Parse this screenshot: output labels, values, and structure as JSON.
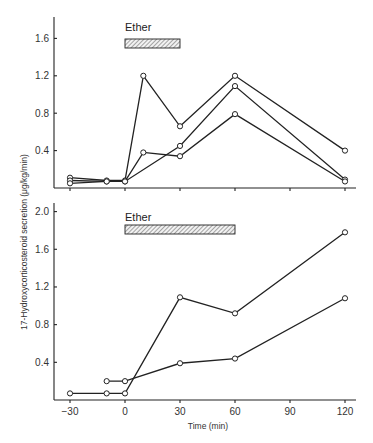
{
  "chart_data": [
    {
      "type": "line",
      "panel": "top",
      "title": "",
      "xlabel": "",
      "ylabel": "17-Hydroxycorticosteroid secretion (μg/kg/min)",
      "x_ticks": [
        -30,
        0,
        30,
        60,
        90,
        120
      ],
      "x_tick_labels_visible": false,
      "y_ticks": [
        0.4,
        0.8,
        1.2,
        1.6
      ],
      "y_tick_labels": [
        "0.4",
        "0.8",
        "1.2",
        "1.6"
      ],
      "xlim": [
        -30,
        120
      ],
      "ylim": [
        0,
        1.8
      ],
      "grid": false,
      "annotation": {
        "label": "Ether",
        "x_start": 0,
        "x_end": 30
      },
      "series": [
        {
          "name": "Subject 1",
          "x": [
            -30,
            -10,
            0,
            10,
            30,
            60,
            120
          ],
          "values": [
            0.11,
            0.08,
            0.08,
            1.2,
            0.66,
            1.2,
            0.4
          ]
        },
        {
          "name": "Subject 2",
          "x": [
            -30,
            -10,
            0,
            30,
            60,
            120
          ],
          "values": [
            0.08,
            0.07,
            0.07,
            0.45,
            1.09,
            0.09
          ]
        },
        {
          "name": "Subject 3",
          "x": [
            -30,
            -10,
            0,
            10,
            30,
            60,
            120
          ],
          "values": [
            0.05,
            0.07,
            0.07,
            0.38,
            0.34,
            0.79,
            0.07
          ]
        }
      ]
    },
    {
      "type": "line",
      "panel": "bottom",
      "title": "",
      "xlabel": "Time (min)",
      "ylabel": "17-Hydroxycorticosteroid secretion (μg/kg/min)",
      "x_ticks": [
        -30,
        0,
        30,
        60,
        90,
        120
      ],
      "x_tick_labels": [
        "−30",
        "0",
        "30",
        "60",
        "90",
        "120"
      ],
      "y_ticks": [
        0.4,
        0.8,
        1.2,
        1.6,
        2.0
      ],
      "y_tick_labels": [
        "0.4",
        "0.8",
        "1.2",
        "1.6",
        "2.0"
      ],
      "xlim": [
        -30,
        120
      ],
      "ylim": [
        0,
        2.1
      ],
      "grid": false,
      "annotation": {
        "label": "Ether",
        "x_start": 0,
        "x_end": 60
      },
      "series": [
        {
          "name": "Subject A",
          "x": [
            -30,
            -10,
            0,
            30,
            60,
            120
          ],
          "values": [
            0.07,
            0.07,
            0.07,
            1.09,
            0.92,
            1.78
          ]
        },
        {
          "name": "Subject B",
          "x": [
            -10,
            0,
            30,
            60,
            120
          ],
          "values": [
            0.2,
            0.2,
            0.39,
            0.44,
            1.08
          ]
        }
      ]
    }
  ],
  "labels": {
    "ylabel": "17-Hydroxycorticosteroid secretion (μg/kg/min)",
    "xlabel": "Time (min)",
    "ether_top": "Ether",
    "ether_bottom": "Ether"
  }
}
